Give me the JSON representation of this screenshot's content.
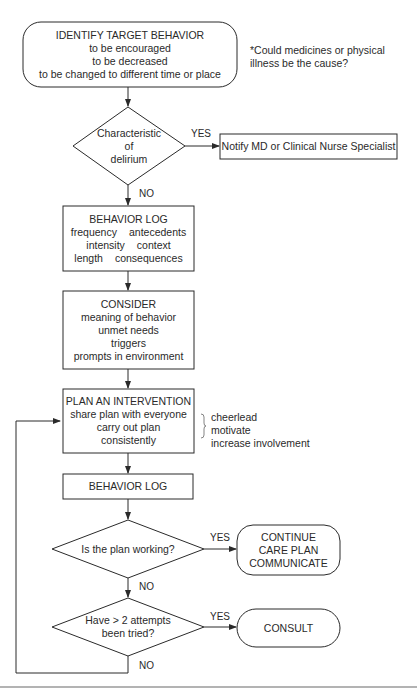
{
  "flowchart": {
    "start": {
      "title": "IDENTIFY TARGET BEHAVIOR",
      "lines": [
        "to be encouraged",
        "to be decreased",
        "to be changed to different time or place"
      ]
    },
    "footnote": {
      "line1": "*Could medicines or physical",
      "line2": "illness be the cause?"
    },
    "decision_delirium": {
      "lines": [
        "Characteristic",
        "of",
        "delirium"
      ],
      "yes_label": "YES",
      "no_label": "NO"
    },
    "notify": {
      "text": "Notify MD or Clinical Nurse Specialist"
    },
    "behavior_log_1": {
      "title": "BEHAVIOR LOG",
      "rows": [
        [
          "frequency",
          "antecedents"
        ],
        [
          "intensity",
          "context"
        ],
        [
          "length",
          "consequences"
        ]
      ]
    },
    "consider": {
      "title": "CONSIDER",
      "lines": [
        "meaning of behavior",
        "unmet needs",
        "triggers",
        "prompts in environment"
      ]
    },
    "plan": {
      "title": "PLAN AN INTERVENTION",
      "lines": [
        "share plan with everyone",
        "carry out plan",
        "consistently"
      ]
    },
    "plan_note": {
      "lines": [
        "cheerlead",
        "motivate",
        "increase involvement"
      ]
    },
    "behavior_log_2": {
      "title": "BEHAVIOR LOG"
    },
    "decision_working": {
      "text": "Is the plan working?",
      "yes_label": "YES",
      "no_label": "NO"
    },
    "continue": {
      "lines": [
        "CONTINUE",
        "CARE PLAN",
        "COMMUNICATE"
      ]
    },
    "decision_attempts": {
      "lines": [
        "Have > 2 attempts",
        "been tried?"
      ],
      "yes_label": "YES",
      "no_label": "NO"
    },
    "consult": {
      "text": "CONSULT"
    }
  },
  "colors": {
    "stroke": "#2a2a2a",
    "text": "#2a2a2a",
    "rule": "#9a9a9a",
    "background": "#ffffff"
  }
}
